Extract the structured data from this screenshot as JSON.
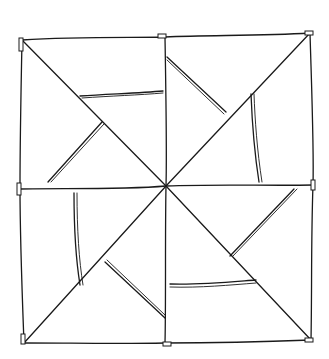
{
  "image": {
    "subject": "hand-drawn pinwheel quilt block sketch",
    "description": "Square block divided into four quadrants with diagonals meeting at center, forming a pinwheel with inner triangles",
    "colors": {
      "background": "#ffffff",
      "ink": "#1a1a1a"
    }
  }
}
